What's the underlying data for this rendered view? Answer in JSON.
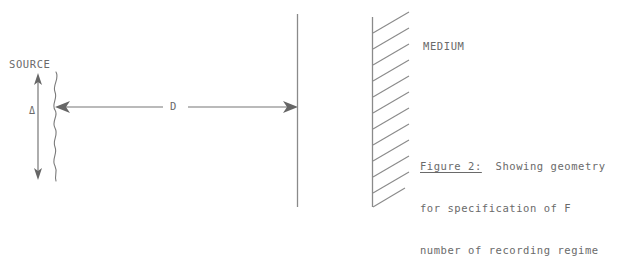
{
  "figure": {
    "labels": {
      "source": "SOURCE",
      "aperture_size": "Δ",
      "distance": "D",
      "medium": "MEDIUM"
    },
    "caption": {
      "title": "Figure 2:",
      "line1_rest": "  Showing geometry",
      "line2": "for specification of F",
      "line3": "number of recording regime"
    },
    "colors": {
      "background": "#ffffff",
      "ink": "#6a6a6a",
      "line": "#777777"
    }
  }
}
